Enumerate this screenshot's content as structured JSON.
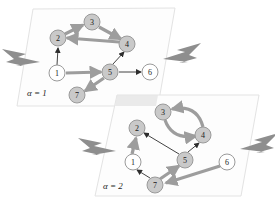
{
  "figure": {
    "background_color": "#ffffff",
    "plane_fill_color": "#fdfdfd",
    "plane_border_color": "#e3e3e3",
    "node_gray_color": "#c9c9c9",
    "node_white_color": "#ffffff",
    "edge_thick_color": "#9d9d9d",
    "edge_thin_color": "#2e2e2e",
    "bolt_color": "#8e8e8e"
  },
  "layers": [
    {
      "id": "layer-alpha-1",
      "caption": "α = 1",
      "caption_x": 27,
      "caption_y": 93,
      "plane_points": "33,9 175,8 158,106 17,106",
      "nodes": [
        {
          "id": "1",
          "label": "1",
          "cx": 57,
          "cy": 73,
          "r": 8,
          "fill": "white"
        },
        {
          "id": "2",
          "label": "2",
          "cx": 58,
          "cy": 38,
          "r": 8,
          "fill": "gray"
        },
        {
          "id": "3",
          "label": "3",
          "cx": 92,
          "cy": 22,
          "r": 8,
          "fill": "gray"
        },
        {
          "id": "4",
          "label": "4",
          "cx": 127,
          "cy": 44,
          "r": 8,
          "fill": "gray"
        },
        {
          "id": "5",
          "label": "5",
          "cx": 110,
          "cy": 72,
          "r": 8,
          "fill": "gray"
        },
        {
          "id": "6",
          "label": "6",
          "cx": 150,
          "cy": 72,
          "r": 8,
          "fill": "white"
        },
        {
          "id": "7",
          "label": "7",
          "cx": 77,
          "cy": 95,
          "r": 8,
          "fill": "gray"
        }
      ],
      "edges": [
        {
          "from": "1",
          "to": "2",
          "weight": "thin"
        },
        {
          "from": "2",
          "to": "3",
          "weight": "thick"
        },
        {
          "from": "3",
          "to": "4",
          "weight": "thick"
        },
        {
          "from": "4",
          "to": "2",
          "weight": "thick"
        },
        {
          "from": "1",
          "to": "5",
          "weight": "thick"
        },
        {
          "from": "5",
          "to": "4",
          "weight": "thin"
        },
        {
          "from": "5",
          "to": "6",
          "weight": "thin"
        },
        {
          "from": "5",
          "to": "7",
          "weight": "thick"
        }
      ],
      "bolts": [
        {
          "id": "bolt-left-1",
          "target_node": "1",
          "points": "2,49 26,54 18,57 40,62 16,66 24,66 6,62 14,59"
        },
        {
          "id": "bolt-right-1",
          "target_node": "6",
          "points": "201,43 177,50 185,52 163,59 188,62 179,63 197,58 189,55"
        }
      ]
    },
    {
      "id": "layer-alpha-2",
      "caption": "α = 2",
      "caption_x": 103,
      "caption_y": 186,
      "plane_points": "117,95 259,95 241,196 95,196",
      "nodes": [
        {
          "id": "1",
          "label": "1",
          "cx": 133,
          "cy": 162,
          "r": 8,
          "fill": "white"
        },
        {
          "id": "2",
          "label": "2",
          "cx": 137,
          "cy": 128,
          "r": 8,
          "fill": "gray"
        },
        {
          "id": "3",
          "label": "3",
          "cx": 163,
          "cy": 112,
          "r": 8,
          "fill": "gray"
        },
        {
          "id": "4",
          "label": "4",
          "cx": 203,
          "cy": 135,
          "r": 8,
          "fill": "gray"
        },
        {
          "id": "5",
          "label": "5",
          "cx": 185,
          "cy": 160,
          "r": 8,
          "fill": "gray"
        },
        {
          "id": "6",
          "label": "6",
          "cx": 227,
          "cy": 162,
          "r": 8,
          "fill": "white"
        },
        {
          "id": "7",
          "label": "7",
          "cx": 155,
          "cy": 185,
          "r": 8,
          "fill": "gray"
        }
      ],
      "edges": [
        {
          "from": "1",
          "to": "2",
          "weight": "thick"
        },
        {
          "from": "5",
          "to": "2",
          "weight": "thin"
        },
        {
          "from": "3",
          "to": "4",
          "weight": "thick",
          "curve": "lower"
        },
        {
          "from": "4",
          "to": "3",
          "weight": "thick",
          "curve": "upper"
        },
        {
          "from": "5",
          "to": "4",
          "weight": "thin"
        },
        {
          "from": "6",
          "to": "7",
          "weight": "thick"
        },
        {
          "from": "7",
          "to": "5",
          "weight": "thick"
        },
        {
          "from": "7",
          "to": "1",
          "weight": "thin"
        }
      ],
      "bolts": [
        {
          "id": "bolt-left-2",
          "target_node": "1",
          "points": "78,138 102,143 94,146 116,151 92,155 100,155 82,151 90,148"
        },
        {
          "id": "bolt-right-2",
          "target_node": "6",
          "points": "278,133 254,140 262,142 240,149 265,152 256,153 274,148 266,145"
        }
      ]
    }
  ]
}
